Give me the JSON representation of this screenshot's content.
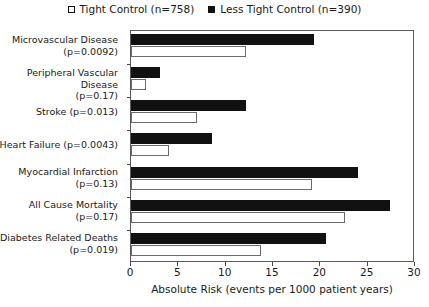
{
  "chart_data": {
    "type": "bar",
    "orientation": "horizontal",
    "title": "",
    "xlabel": "Absolute Risk (events per 1000 patient years)",
    "ylabel": "",
    "xlim": [
      0,
      30
    ],
    "xticks": [
      0,
      5,
      10,
      15,
      20,
      25,
      30
    ],
    "grid": false,
    "legend_position": "top-center",
    "categories": [
      "Microvascular Disease\n(p=0.0092)",
      "Peripheral Vascular Disease\n(p=0.17)",
      "Stroke (p=0.013)",
      "Heart Failure (p=0.0043)",
      "Myocardial Infarction\n(p=0.13)",
      "All Cause Mortality\n(p=0.17)",
      "Diabetes Related Deaths\n(p=0.019)"
    ],
    "category_lines": [
      [
        "Microvascular Disease",
        "(p=0.0092)"
      ],
      [
        "Peripheral Vascular Disease",
        "(p=0.17)"
      ],
      [
        "Stroke (p=0.013)"
      ],
      [
        "Heart Failure (p=0.0043)"
      ],
      [
        "Myocardial Infarction",
        "(p=0.13)"
      ],
      [
        "All Cause Mortality",
        "(p=0.17)"
      ],
      [
        "Diabetes Related Deaths",
        "(p=0.019)"
      ]
    ],
    "p_values": [
      "0.0092",
      "0.17",
      "0.013",
      "0.0043",
      "0.13",
      "0.17",
      "0.019"
    ],
    "series": [
      {
        "name": "Tight Control (n=758)",
        "style": "open",
        "color": "#ffffff",
        "values": [
          12.2,
          1.6,
          7.0,
          4.0,
          19.1,
          22.6,
          13.7
        ]
      },
      {
        "name": "Less Tight Control (n=390)",
        "style": "filled",
        "color": "#111111",
        "values": [
          19.3,
          3.1,
          12.1,
          8.6,
          24.0,
          27.4,
          20.6
        ]
      }
    ]
  },
  "legend": {
    "entries": [
      {
        "label": "Tight Control (n=758)",
        "marker": "open-square"
      },
      {
        "label": "Less Tight Control (n=390)",
        "marker": "filled-square"
      }
    ]
  },
  "axis": {
    "x_title": "Absolute Risk (events per 1000 patient years)",
    "x_tick_labels": [
      "0",
      "5",
      "10",
      "15",
      "20",
      "25",
      "30"
    ]
  }
}
